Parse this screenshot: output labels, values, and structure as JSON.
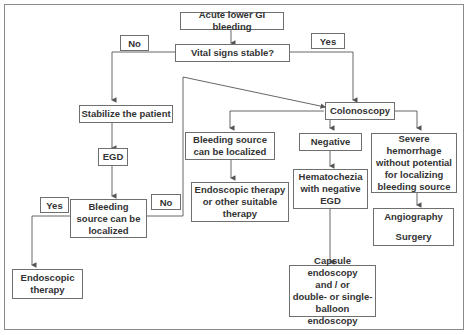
{
  "diagram": {
    "title": "Acute lower GI bleeding",
    "nodes": {
      "start": "Acute lower GI bleeding",
      "vitals": "Vital signs stable?",
      "stabilize": "Stabilize the patient",
      "egd": "EGD",
      "bleeding_localized_egd": "Bleeding\nsource can be\nlocalized",
      "endoscopic_therapy": "Endoscopic\ntherapy",
      "colonoscopy": "Colonoscopy",
      "bleeding_localized_colo": "Bleeding source\ncan be localized",
      "endo_or_other": "Endoscopic therapy\nor other suitable\ntherapy",
      "negative": "Negative",
      "hematochezia": "Hematochezia\nwith negative\nEGD",
      "capsule": "Capsule endoscopy\nand / or\ndouble- or single-\nballoon endoscopy",
      "severe": "Severe\nhemorrhage\nwithout potential\nfor localizing\nbleeding source",
      "angio_surgery_top": "Angiography",
      "angio_surgery_bottom": "Surgery"
    },
    "edge_labels": {
      "vitals_no": "No",
      "vitals_yes": "Yes",
      "bleeding_yes": "Yes",
      "bleeding_no": "No"
    },
    "colors": {
      "line": "#555555",
      "border": "#6f6f6f",
      "text": "#333333"
    }
  }
}
